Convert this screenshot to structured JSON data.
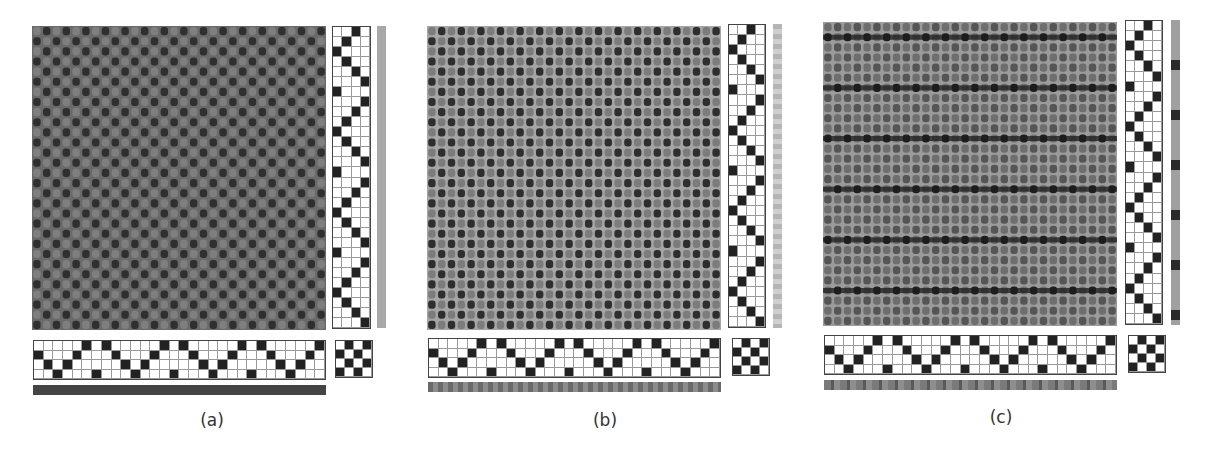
{
  "figure": {
    "panels": [
      {
        "id": "a",
        "caption": "(a)",
        "fabric": {
          "cols": 30,
          "rows": 30,
          "warp_color": "#7f7f7f",
          "weft_color": "#3a3a3a",
          "ground": "#6a6a6a",
          "stripe": false
        },
        "warp_bar_color": "#444444",
        "weft_bar": {
          "type": "solid",
          "color": "#a8a8a8"
        }
      },
      {
        "id": "b",
        "caption": "(b)",
        "fabric": {
          "cols": 30,
          "rows": 30,
          "warp_color": "#8a8a8a",
          "weft_color": "#3a3a3a",
          "ground": "#a5a5a5",
          "stripe": false
        },
        "warp_bar_color": "#7a7a7a",
        "weft_bar": {
          "type": "solid",
          "color": "#bdbdbd"
        }
      },
      {
        "id": "c",
        "caption": "(c)",
        "fabric": {
          "cols": 30,
          "rows": 30,
          "warp_color": "#6e6e6e",
          "weft_color": "#555555",
          "ground": "#9b9b9b",
          "stripe": true,
          "stripe_color": "#1e1e1e",
          "stripe_every": 5
        },
        "warp_bar_color": "#7a7a7a",
        "weft_bar": {
          "type": "striped",
          "color": "#a0a0a0",
          "stripe_color": "#2a2a2a",
          "stripe_every": 5
        }
      }
    ],
    "threading": {
      "cols": 30,
      "rows": 4,
      "filled_row_per_col": [
        1,
        2,
        3,
        2,
        1,
        0,
        3,
        0,
        1,
        2,
        3,
        2,
        1,
        0,
        3,
        0,
        1,
        2,
        3,
        2,
        1,
        0,
        3,
        0,
        1,
        2,
        3,
        2,
        1,
        0
      ]
    },
    "treadling": {
      "cols": 4,
      "rows": 30,
      "filled_col_per_row": [
        2,
        1,
        0,
        1,
        2,
        3,
        0,
        3,
        2,
        1,
        0,
        1,
        2,
        3,
        0,
        3,
        2,
        1,
        0,
        1,
        2,
        3,
        0,
        3,
        2,
        1,
        0,
        1,
        2,
        3
      ]
    },
    "tieup": {
      "cols": 4,
      "rows": 4,
      "filled": [
        [
          1,
          3
        ],
        [
          0,
          2
        ],
        [
          1,
          3
        ],
        [
          0,
          2
        ]
      ]
    }
  }
}
